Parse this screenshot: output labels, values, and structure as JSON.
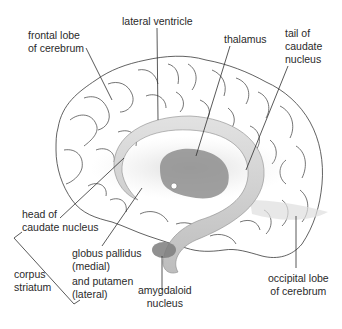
{
  "diagram": {
    "colors": {
      "outline": "#3a3a3a",
      "leader_line": "#2e2e2e",
      "shading_light": "#e6e6e6",
      "shading_mid": "#c4c4c4",
      "shading_dark": "#8e8e8e",
      "text": "#2a2a2a",
      "background": "#ffffff"
    },
    "labels": {
      "frontal_lobe": {
        "line1": "frontal lobe",
        "line2": "of cerebrum"
      },
      "lateral_ventricle": {
        "line1": "lateral ventricle"
      },
      "thalamus": {
        "line1": "thalamus"
      },
      "tail_caudate": {
        "line1": "tail of",
        "line2": "caudate",
        "line3": "nucleus"
      },
      "head_caudate": {
        "line1": "head of",
        "line2": "caudate nucleus"
      },
      "corpus_striatum": {
        "line1": "corpus",
        "line2": "striatum"
      },
      "globus_pallidus": {
        "line1": "globus pallidus",
        "line2": "(medial)",
        "line3": "and putamen",
        "line4": "(lateral)"
      },
      "amygdaloid": {
        "line1": "amygdaloid",
        "line2": "nucleus"
      },
      "occipital_lobe": {
        "line1": "occipital lobe",
        "line2": "of cerebrum"
      }
    }
  }
}
